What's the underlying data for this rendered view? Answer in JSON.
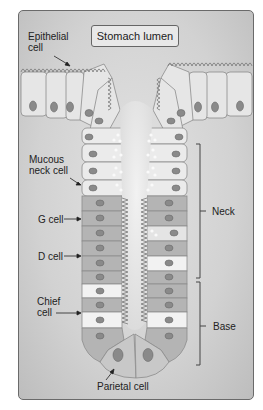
{
  "diagram": {
    "title_box": "Stomach lumen",
    "labels": {
      "epithelial": [
        "Epithelial",
        "cell"
      ],
      "mucous_neck": [
        "Mucous",
        "neck cell"
      ],
      "g_cell": "G cell",
      "d_cell": "D cell",
      "chief": [
        "Chief",
        "cell"
      ],
      "parietal": "Parietal cell"
    },
    "regions": {
      "neck": "Neck",
      "base": "Base"
    },
    "colors": {
      "frame_bg": "#d4d4d4",
      "surface_cell": "#e6e6e6",
      "mucous_cell": "#ebebeb",
      "dark_cell": "#b4b4b4",
      "chief_cell": "#f2f2f2",
      "parietal_cell": "#c8c8c8",
      "nucleus": "#8a8a8a",
      "outline": "#8c8c8c",
      "text": "#222222"
    }
  }
}
